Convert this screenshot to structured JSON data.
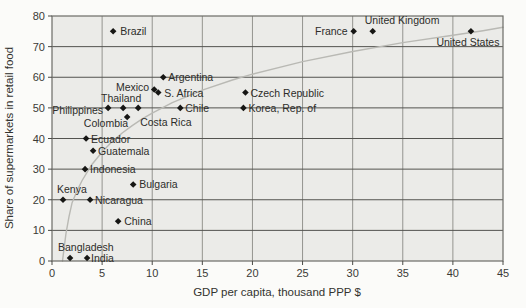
{
  "figure": {
    "bg_color": "#fbfbf9",
    "plot_bg_color": "#ebebe8",
    "grid_h_color": "#53534f",
    "grid_v_color": "#94948f",
    "border_color": "#6b6b66",
    "tick_color": "#4a4a46",
    "curve_color": "#b9b9b4",
    "marker_color": "#161614",
    "text_color": "#2d2d2a",
    "tick_label_color": "#3a3a36"
  },
  "chart_data": {
    "type": "scatter",
    "title": "",
    "xlabel": "GDP per capita, thousand PPP $",
    "ylabel": "Share of supermarkets in retail food",
    "xlim": [
      0,
      45
    ],
    "ylim": [
      0,
      80
    ],
    "x_ticks": [
      0,
      5,
      10,
      15,
      20,
      25,
      30,
      35,
      40,
      45
    ],
    "y_ticks": [
      0,
      10,
      20,
      30,
      40,
      50,
      60,
      70,
      80
    ],
    "grid": true,
    "marker": "diamond",
    "points": [
      {
        "label": "Brazil",
        "x": 6.1,
        "y": 75,
        "lx": 7,
        "ly": 4,
        "anchor": "start"
      },
      {
        "label": "France",
        "x": 30.1,
        "y": 75,
        "lx": -6,
        "ly": 4,
        "anchor": "end"
      },
      {
        "label": "United Kingdom",
        "x": 32.0,
        "y": 75,
        "lx": -8,
        "ly": -7,
        "anchor": "start"
      },
      {
        "label": "United States",
        "x": 41.8,
        "y": 75,
        "lx": -3,
        "ly": 15,
        "anchor": "middle"
      },
      {
        "label": "Czech Republic",
        "x": 19.3,
        "y": 55,
        "lx": 5,
        "ly": 4,
        "anchor": "start"
      },
      {
        "label": "Korea, Rep. of",
        "x": 19.1,
        "y": 50,
        "lx": 5,
        "ly": 4,
        "anchor": "start"
      },
      {
        "label": "Argentina",
        "x": 11.1,
        "y": 60,
        "lx": 5,
        "ly": 4,
        "anchor": "start"
      },
      {
        "label": "Mexico",
        "x": 10.2,
        "y": 56,
        "lx": -5,
        "ly": 1,
        "anchor": "end"
      },
      {
        "label": "S. Africa",
        "x": 10.6,
        "y": 55,
        "lx": 6,
        "ly": 4,
        "anchor": "start"
      },
      {
        "label": "Chile",
        "x": 12.8,
        "y": 50,
        "lx": 5,
        "ly": 4,
        "anchor": "start"
      },
      {
        "label": "Thailand",
        "x": 7.1,
        "y": 50,
        "lx": -2,
        "ly": -6,
        "anchor": "middle"
      },
      {
        "label": "Philippines",
        "x": 5.6,
        "y": 50,
        "lx": -5,
        "ly": 6,
        "anchor": "end"
      },
      {
        "label": "Costa Rica",
        "x": 8.6,
        "y": 50,
        "lx": 2,
        "ly": 18,
        "anchor": "start"
      },
      {
        "label": "Colombia",
        "x": 7.5,
        "y": 47,
        "lx": 1,
        "ly": 10,
        "anchor": "end"
      },
      {
        "label": "Ecuador",
        "x": 3.4,
        "y": 40,
        "lx": 5,
        "ly": 4,
        "anchor": "start"
      },
      {
        "label": "Guatemala",
        "x": 4.1,
        "y": 36,
        "lx": 5,
        "ly": 4,
        "anchor": "start"
      },
      {
        "label": "Indonesia",
        "x": 3.3,
        "y": 30,
        "lx": 5,
        "ly": 4,
        "anchor": "start"
      },
      {
        "label": "Bulgaria",
        "x": 8.1,
        "y": 25,
        "lx": 6,
        "ly": 4,
        "anchor": "start"
      },
      {
        "label": "Kenya",
        "x": 1.1,
        "y": 20,
        "lx": -6,
        "ly": -7,
        "anchor": "start"
      },
      {
        "label": "Nicaragua",
        "x": 3.8,
        "y": 20,
        "lx": 5,
        "ly": 4,
        "anchor": "start"
      },
      {
        "label": "China",
        "x": 6.6,
        "y": 13,
        "lx": 6,
        "ly": 4,
        "anchor": "start"
      },
      {
        "label": "Bangladesh",
        "x": 1.8,
        "y": 1,
        "lx": -12,
        "ly": -7,
        "anchor": "start"
      },
      {
        "label": "India",
        "x": 3.5,
        "y": 1,
        "lx": 4,
        "ly": 4,
        "anchor": "start"
      }
    ],
    "trend_curve": [
      [
        1.05,
        0
      ],
      [
        1.2,
        4
      ],
      [
        1.4,
        9
      ],
      [
        1.7,
        14.5
      ],
      [
        2,
        18.9
      ],
      [
        2.5,
        23
      ],
      [
        3,
        26.3
      ],
      [
        4,
        31.6
      ],
      [
        5,
        35.6
      ],
      [
        6,
        39
      ],
      [
        7,
        41.8
      ],
      [
        8,
        44.2
      ],
      [
        9,
        46.4
      ],
      [
        10,
        48.3
      ],
      [
        12,
        51.7
      ],
      [
        15,
        55.8
      ],
      [
        18,
        59.1
      ],
      [
        20,
        61
      ],
      [
        25,
        65.1
      ],
      [
        30,
        68.4
      ],
      [
        35,
        71.3
      ],
      [
        40,
        73.7
      ],
      [
        43,
        75.2
      ],
      [
        45,
        76.3
      ]
    ]
  }
}
